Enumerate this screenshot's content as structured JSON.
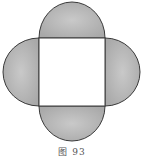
{
  "figure": {
    "caption": "图 93",
    "colors": {
      "lobe_fill": "#b3b3b3",
      "lobe_fill_light": "#d0d0d0",
      "square_fill": "#ffffff",
      "stroke": "#3a3a3a"
    },
    "shapes": {
      "square": {
        "x": 39,
        "y": 38,
        "width": 66,
        "height": 68
      },
      "lobes": [
        "top",
        "right",
        "bottom",
        "left"
      ]
    }
  }
}
